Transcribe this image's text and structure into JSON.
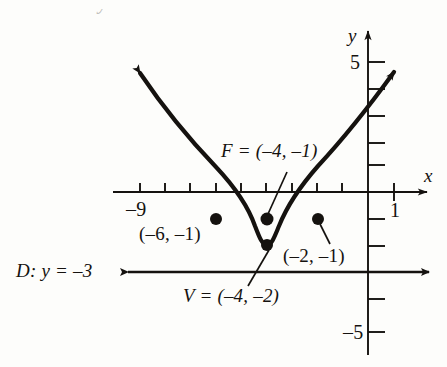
{
  "figure": {
    "type": "graph",
    "title_partial": "Directrix: y = –3",
    "axes": {
      "x_axis_label": "x",
      "y_axis_label": "y",
      "x_ticks_labeled": [
        {
          "value": -9,
          "text": "–9"
        },
        {
          "value": 1,
          "text": "1"
        }
      ],
      "y_ticks_labeled": [
        {
          "value": 5,
          "text": "5"
        },
        {
          "value": -5,
          "text": "–5"
        }
      ],
      "x_range": [
        -10.2,
        2.4
      ],
      "y_range": [
        -6.3,
        6.3
      ]
    },
    "curve": {
      "kind": "parabola",
      "vertex": [
        -4,
        -2
      ],
      "opens": "up",
      "equation_form": "(x+4)^2 = 4(y+2)",
      "focal_length": 1,
      "arrow_ends": true
    },
    "directrix": {
      "label": "D: y = –3",
      "y_value": -3,
      "double_arrow": true
    },
    "points": [
      {
        "name": "focus",
        "label": "F = (–4, –1)",
        "coords": [
          -4,
          -1
        ],
        "leader": true
      },
      {
        "name": "vertex",
        "label": "V = (–4, –2)",
        "coords": [
          -4,
          -2
        ],
        "leader": true
      },
      {
        "name": "latus-left",
        "label": "(–6, –1)",
        "coords": [
          -6,
          -1
        ],
        "leader": false
      },
      {
        "name": "latus-right",
        "label": "(–2, –1)",
        "coords": [
          -2,
          -1
        ],
        "leader": true
      }
    ],
    "colors": {
      "ink": "#15120f",
      "paper": "#fdfdfb"
    }
  }
}
